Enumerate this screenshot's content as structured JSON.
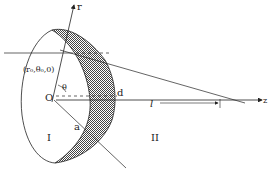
{
  "diagram": {
    "labels": {
      "r_axis": "r",
      "z_axis": "z",
      "origin": "O",
      "theta": "θ",
      "point": "(r₀,θ₀,0)",
      "d": "d",
      "a": "a",
      "l": "l",
      "region_1": "I",
      "region_2": "II"
    },
    "colors": {
      "line": "#222222",
      "hatch": "#555555",
      "background": "#ffffff"
    }
  }
}
